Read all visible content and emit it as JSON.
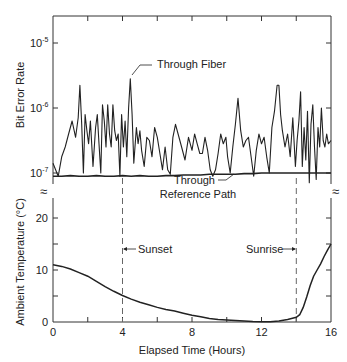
{
  "chart_data": {
    "type": "line",
    "title": "",
    "xlabel": "Elapsed Time (Hours)",
    "xlim": [
      0,
      16
    ],
    "xticks": [
      0,
      4,
      8,
      12,
      16
    ],
    "x_minor_ticks": [
      2,
      6,
      10,
      14
    ],
    "panels": [
      {
        "name": "bit-error-rate",
        "ylabel": "Bit Error Rate",
        "yscale": "log",
        "ylim": [
          7e-08,
          3e-05
        ],
        "yticks": [
          {
            "value": 1e-05,
            "label": "10",
            "exp": "-5"
          },
          {
            "value": 1e-06,
            "label": "10",
            "exp": "-6"
          },
          {
            "value": 1e-07,
            "label": "10",
            "exp": "-7"
          }
        ],
        "series": [
          {
            "name": "Through Fiber",
            "x": [
              0,
              0.15,
              0.3,
              0.5,
              0.7,
              0.9,
              1.1,
              1.3,
              1.45,
              1.55,
              1.65,
              1.75,
              1.85,
              1.95,
              2.05,
              2.15,
              2.3,
              2.45,
              2.55,
              2.65,
              2.75,
              2.85,
              2.95,
              3.05,
              3.15,
              3.25,
              3.35,
              3.45,
              3.55,
              3.65,
              3.75,
              3.85,
              3.95,
              4.05,
              4.15,
              4.25,
              4.35,
              4.45,
              4.55,
              4.65,
              4.8,
              4.9,
              5.0,
              5.1,
              5.25,
              5.4,
              5.55,
              5.7,
              5.85,
              6.0,
              6.15,
              6.3,
              6.45,
              6.6,
              6.75,
              6.9,
              7.05,
              7.2,
              7.4,
              7.6,
              7.8,
              8.0,
              8.15,
              8.3,
              8.45,
              8.6,
              8.75,
              8.9,
              9.05,
              9.2,
              9.35,
              9.5,
              9.65,
              9.8,
              9.95,
              10.05,
              10.2,
              10.35,
              10.5,
              10.65,
              10.8,
              10.95,
              11.1,
              11.25,
              11.4,
              11.55,
              11.7,
              11.85,
              12.0,
              12.15,
              12.3,
              12.45,
              12.6,
              12.75,
              12.9,
              13.0,
              13.1,
              13.2,
              13.35,
              13.5,
              13.65,
              13.8,
              13.95,
              14.05,
              14.15,
              14.25,
              14.35,
              14.45,
              14.55,
              14.65,
              14.75,
              14.85,
              14.95,
              15.05,
              15.15,
              15.25,
              15.35,
              15.45,
              15.55,
              15.65,
              15.75,
              15.85,
              16.0
            ],
            "y_log10": [
              -6.85,
              -6.95,
              -7.05,
              -6.75,
              -6.6,
              -6.4,
              -6.2,
              -6.45,
              -6.15,
              -5.65,
              -6.25,
              -7.0,
              -6.1,
              -6.35,
              -6.55,
              -6.2,
              -6.9,
              -6.3,
              -6.1,
              -6.55,
              -7.0,
              -5.95,
              -6.2,
              -6.6,
              -5.95,
              -6.4,
              -6.6,
              -5.95,
              -6.35,
              -6.5,
              -6.4,
              -7.05,
              -6.1,
              -6.6,
              -6.2,
              -6.75,
              -6.0,
              -5.55,
              -6.1,
              -6.85,
              -6.3,
              -6.55,
              -6.35,
              -6.65,
              -6.9,
              -6.45,
              -6.5,
              -6.75,
              -6.3,
              -6.45,
              -6.7,
              -6.95,
              -6.6,
              -6.95,
              -7.02,
              -6.45,
              -6.25,
              -6.4,
              -6.6,
              -6.8,
              -6.45,
              -6.65,
              -6.4,
              -6.55,
              -6.7,
              -6.7,
              -6.45,
              -6.65,
              -6.95,
              -7.05,
              -6.95,
              -6.7,
              -6.4,
              -6.55,
              -6.45,
              -6.75,
              -7.0,
              -6.6,
              -6.25,
              -5.85,
              -6.35,
              -6.6,
              -6.5,
              -6.45,
              -6.75,
              -7.05,
              -6.65,
              -6.4,
              -6.55,
              -6.45,
              -6.75,
              -7.0,
              -6.3,
              -6.05,
              -5.65,
              -5.65,
              -6.1,
              -6.35,
              -6.6,
              -6.4,
              -6.75,
              -6.15,
              -6.9,
              -6.5,
              -6.2,
              -5.75,
              -6.9,
              -6.3,
              -6.8,
              -6.05,
              -7.15,
              -6.25,
              -5.95,
              -6.6,
              -7.1,
              -6.3,
              -6.6,
              -6.0,
              -6.5,
              -6.6,
              -6.4,
              -6.55,
              -6.5,
              -6.8,
              -6.45
            ]
          },
          {
            "name": "Through Reference Path",
            "x": [
              0,
              0.5,
              1,
              1.5,
              2,
              2.5,
              3,
              3.5,
              4,
              4.5,
              5,
              5.5,
              6,
              6.5,
              7,
              7.5,
              8,
              8.5,
              9,
              9.5,
              10,
              10.5,
              11,
              11.5,
              12,
              12.5,
              13,
              13.5,
              14,
              14.5,
              15,
              15.5,
              16
            ],
            "y_log10": [
              -7.05,
              -7.05,
              -7.04,
              -7.05,
              -7.05,
              -7.04,
              -7.05,
              -7.05,
              -7.04,
              -7.05,
              -7.04,
              -7.05,
              -7.05,
              -7.04,
              -7.04,
              -7.03,
              -7.03,
              -7.03,
              -7.02,
              -7.02,
              -7.02,
              -7.02,
              -7.01,
              -7.01,
              -7.0,
              -7.0,
              -7.0,
              -7.0,
              -7.0,
              -7.0,
              -7.0,
              -7.0,
              -7.0
            ]
          }
        ],
        "annotations": [
          {
            "text": "Through Fiber",
            "points_to_hour": 4.45
          },
          {
            "text_lines": [
              "Through",
              "Reference Path"
            ],
            "points_to_hour": 10.0
          }
        ]
      },
      {
        "name": "ambient-temperature",
        "ylabel": "Ambient Temperature (°C)",
        "yscale": "linear",
        "ylim": [
          0,
          25
        ],
        "yticks": [
          0,
          10,
          20
        ],
        "y_minor_ticks": [
          5,
          15
        ],
        "series": [
          {
            "name": "Ambient Temperature",
            "x": [
              0,
              0.5,
              1,
              1.5,
              2,
              2.5,
              3,
              3.5,
              4,
              4.5,
              5,
              5.5,
              6,
              6.5,
              7,
              7.5,
              8,
              8.5,
              9,
              9.5,
              10,
              10.5,
              11,
              11.5,
              12,
              12.5,
              13,
              13.5,
              14,
              14.2,
              14.4,
              14.6,
              14.8,
              15,
              15.2,
              15.4,
              15.6,
              15.8,
              16
            ],
            "values": [
              11.0,
              10.7,
              10.2,
              9.5,
              8.8,
              7.8,
              6.8,
              5.9,
              5.1,
              4.4,
              3.8,
              3.3,
              2.8,
              2.4,
              2.1,
              1.7,
              1.3,
              1.0,
              0.7,
              0.5,
              0.4,
              0.3,
              0.2,
              0.1,
              0.05,
              0.05,
              0.2,
              0.5,
              0.9,
              1.4,
              2.8,
              4.8,
              7.0,
              8.8,
              10.0,
              11.2,
              12.6,
              13.8,
              15.0
            ]
          }
        ],
        "annotations": [
          {
            "text": "Sunset",
            "hour": 4.0,
            "style": "dashed-vertical"
          },
          {
            "text": "Sunrise",
            "hour": 14.0,
            "style": "dashed-vertical"
          }
        ]
      }
    ],
    "grid": false,
    "legend": "none (inline labels)",
    "axis_break_symbol": "≈"
  },
  "labels": {
    "ber_ylabel": "Bit Error Rate",
    "temp_ylabel": "Ambient Temperature (°C)",
    "xlabel": "Elapsed Time (Hours)",
    "fiber": "Through Fiber",
    "ref_line1": "Through",
    "ref_line2": "Reference Path",
    "sunset": "Sunset",
    "sunrise": "Sunrise",
    "break": "≈"
  }
}
